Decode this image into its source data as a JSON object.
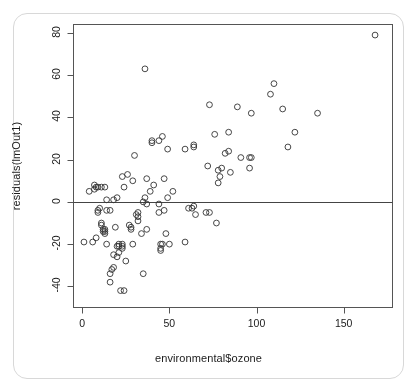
{
  "chart_data": {
    "type": "scatter",
    "title": "",
    "xlabel": "environmental$ozone",
    "ylabel": "residuals(lmOut1)",
    "xlim": [
      -5,
      178
    ],
    "ylim": [
      -50,
      84
    ],
    "xticks": [
      0,
      50,
      100,
      150
    ],
    "yticks": [
      80,
      60,
      40,
      20,
      0,
      -20,
      -40
    ],
    "grid": false,
    "legend": null,
    "marker": "open-circle",
    "reference_lines": [
      {
        "orientation": "horizontal",
        "y": 0
      }
    ],
    "point_color": "#333333",
    "n_points": 111,
    "x": [
      1,
      4,
      6,
      7,
      7,
      8,
      8,
      9,
      9,
      9,
      10,
      11,
      11,
      11,
      12,
      12,
      13,
      13,
      13,
      13,
      14,
      14,
      14,
      16,
      16,
      16,
      17,
      18,
      18,
      18,
      19,
      20,
      20,
      20,
      21,
      21,
      21,
      22,
      23,
      23,
      23,
      23,
      24,
      24,
      25,
      26,
      27,
      28,
      28,
      29,
      29,
      30,
      31,
      32,
      32,
      32,
      34,
      35,
      35,
      36,
      36,
      37,
      37,
      37,
      39,
      40,
      40,
      41,
      44,
      44,
      44,
      45,
      45,
      45,
      46,
      46,
      47,
      47,
      48,
      49,
      49,
      50,
      52,
      59,
      59,
      61,
      63,
      64,
      64,
      64,
      65,
      71,
      72,
      73,
      73,
      76,
      77,
      78,
      78,
      79,
      80,
      82,
      84,
      84,
      85,
      89,
      91,
      96,
      96,
      97,
      97,
      108,
      110,
      115,
      118,
      122,
      135,
      168
    ],
    "y": [
      -19,
      5,
      -19,
      6,
      8,
      -17,
      7,
      -4,
      -5,
      7,
      -3,
      -11,
      -10,
      7,
      -13,
      -14,
      -13,
      -14,
      -15,
      7,
      -20,
      -4,
      1,
      -34,
      -38,
      -4,
      -32,
      -31,
      -25,
      1,
      -12,
      -21,
      -26,
      2,
      -20,
      -21,
      -24,
      -42,
      -20,
      -21,
      -22,
      12,
      -42,
      7,
      -28,
      13,
      -11,
      -13,
      -12,
      -20,
      10,
      22,
      -6,
      -5,
      -9,
      -7,
      -15,
      -34,
      0,
      2,
      63,
      -13,
      -1,
      11,
      5,
      28,
      29,
      8,
      -1,
      -5,
      29,
      -20,
      -22,
      -23,
      31,
      -20,
      -4,
      11,
      -15,
      25,
      2,
      -20,
      5,
      -19,
      25,
      -3,
      -3,
      27,
      26,
      -2,
      -6,
      -5,
      17,
      46,
      -5,
      32,
      -10,
      15,
      9,
      12,
      16,
      23,
      24,
      33,
      14,
      45,
      21,
      16,
      21,
      42,
      21,
      51,
      56,
      44,
      26,
      33,
      42,
      79
    ]
  }
}
